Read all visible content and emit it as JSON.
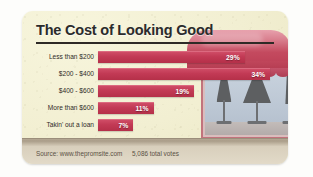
{
  "card": {
    "title": "The Cost of Looking Good"
  },
  "chart_data": {
    "type": "bar",
    "title": "The Cost of Looking Good",
    "orientation": "horizontal",
    "xlabel": "",
    "ylabel": "",
    "categories": [
      "Less than $200",
      "$200 - $400",
      "$400 - $600",
      "More than $600",
      "Takin' out a loan"
    ],
    "values": [
      29,
      34,
      19,
      11,
      7
    ],
    "value_labels": [
      "29%",
      "34%",
      "19%",
      "11%",
      "7%"
    ],
    "unit": "%",
    "xlim": [
      0,
      34
    ],
    "grid": false,
    "legend": false,
    "bar_color": "#c23a55",
    "label_color": "#ffffff"
  },
  "footer": {
    "source": "Source: www.thepromsite.com",
    "votes": "5,086 total votes"
  },
  "illustration": {
    "name": "dress-shop-storefront",
    "awning_color": "#c44a5f",
    "window_color": "#bcc7d4",
    "mannequin_color": "#5d5f61"
  }
}
